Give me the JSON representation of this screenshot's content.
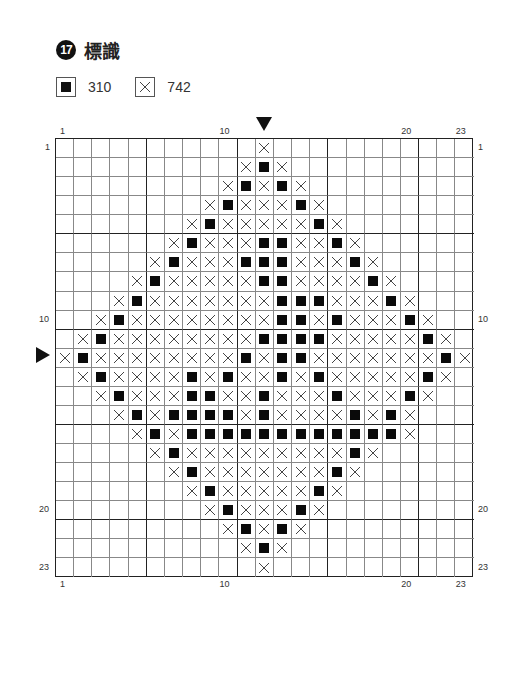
{
  "title": {
    "number": "17",
    "text": "標識"
  },
  "legend": [
    {
      "symbol": "filled-square",
      "code": "310"
    },
    {
      "symbol": "cross",
      "code": "742"
    }
  ],
  "colors": {
    "ink": "#111111",
    "grid_thin": "#888888",
    "grid_thick": "#222222",
    "background": "#ffffff"
  },
  "chart_data": {
    "type": "cross-stitch-pattern",
    "columns": 23,
    "rows": 23,
    "center_column": 12,
    "center_row": 12,
    "legend_key": {
      "o": "310 (filled square)",
      "x": "742 (cross)",
      ".": "empty"
    },
    "grid": [
      "...........x...........",
      "..........xox..........",
      ".........xoxox.........",
      "........xoxxxox........",
      ".......xoxxxxxox.......",
      "......xoxxxooxxox......",
      ".....xoxxxoooxxxox.....",
      "....xoxxxxxooxxxxox....",
      "...xoxxxxxxxoooxxxox...",
      "..xoxxxxxxxxooxoxxxox..",
      ".xoxxxxxxxxooooxxxxxox.",
      "xoxxxxxxxxoxooxxxxxxxox",
      ".xoxxxxoxoxxoxoxxxxxox.",
      "..xoxxxooxxoxxxoxxxox..",
      "...xoxooooxoxxxxoxox...",
      "....xoxoooooooooooox....",
      ".....xoxxxxxxxxxox.....",
      "......xoxxxxxxxox......",
      ".......xoxxxxxox.......",
      "........xoxxxox........",
      ".........xoxox.........",
      "..........xox..........",
      "...........x..........."
    ]
  },
  "axis_labels": {
    "top": [
      {
        "text": "1",
        "col": 1
      },
      {
        "text": "10",
        "col": 10
      },
      {
        "text": "20",
        "col": 20
      },
      {
        "text": "23",
        "col": 23
      }
    ],
    "bottom": [
      {
        "text": "1",
        "col": 1
      },
      {
        "text": "10",
        "col": 10
      },
      {
        "text": "20",
        "col": 20
      },
      {
        "text": "23",
        "col": 23
      }
    ],
    "left": [
      {
        "text": "1",
        "row": 1
      },
      {
        "text": "10",
        "row": 10
      },
      {
        "text": "20",
        "row": 20
      },
      {
        "text": "23",
        "row": 23
      }
    ],
    "right": [
      {
        "text": "1",
        "row": 1
      },
      {
        "text": "10",
        "row": 10
      },
      {
        "text": "20",
        "row": 20
      },
      {
        "text": "23",
        "row": 23
      }
    ]
  },
  "center_markers": {
    "top_arrow_col": 12,
    "left_arrow_row": 12
  }
}
